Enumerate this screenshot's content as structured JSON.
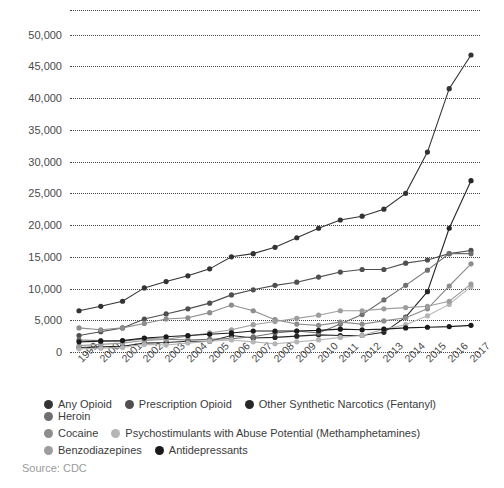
{
  "source_note": "Source: CDC",
  "chart_data": {
    "type": "line",
    "title": "",
    "xlabel": "",
    "ylabel": "",
    "ylim": [
      0,
      52000
    ],
    "yticks": [
      "0",
      "5,000",
      "10,000",
      "15,000",
      "20,000",
      "25,000",
      "30,000",
      "35,000",
      "40,000",
      "45,000",
      "50,000"
    ],
    "ytick_values": [
      0,
      5000,
      10000,
      15000,
      20000,
      25000,
      30000,
      35000,
      40000,
      45000,
      50000
    ],
    "grid": "horizontal-dotted",
    "legend_position": "bottom",
    "categories": [
      "1999",
      "2000",
      "2001",
      "2002",
      "2003",
      "2004",
      "2005",
      "2006",
      "2007",
      "2008",
      "2009",
      "2010",
      "2011",
      "2012",
      "2013",
      "2014",
      "2015",
      "2016",
      "2017"
    ],
    "series": [
      {
        "name": "Any Opioid",
        "color": "#333333",
        "values": [
          6500,
          7200,
          8000,
          10100,
          11100,
          12000,
          13100,
          15000,
          15500,
          16500,
          18000,
          19500,
          20800,
          21400,
          22500,
          25000,
          31500,
          41500,
          46800
        ]
      },
      {
        "name": "Prescription Opioid",
        "color": "#4f4f4f",
        "values": [
          2600,
          3200,
          3800,
          5200,
          6000,
          6800,
          7700,
          9000,
          9800,
          10500,
          11000,
          11800,
          12600,
          13000,
          13000,
          14000,
          14500,
          15500,
          16000
        ]
      },
      {
        "name": "Other Synthetic Narcotics (Fentanyl)",
        "color": "#262626",
        "values": [
          700,
          800,
          900,
          1400,
          1500,
          1700,
          1700,
          2600,
          2200,
          2300,
          2500,
          2700,
          2600,
          2600,
          3100,
          5500,
          9500,
          19500,
          27000
        ]
      },
      {
        "name": "Heroin",
        "color": "#6f6f6f",
        "values": [
          1900,
          1800,
          1700,
          2100,
          2000,
          1900,
          2000,
          2100,
          2400,
          3000,
          3300,
          3000,
          4400,
          5900,
          8200,
          10500,
          12900,
          15500,
          15500
        ]
      },
      {
        "name": "Cocaine",
        "color": "#8d8d8d",
        "values": [
          3800,
          3500,
          3800,
          4500,
          5200,
          5400,
          6200,
          7400,
          6500,
          5100,
          4400,
          4200,
          4700,
          4400,
          4900,
          5400,
          6800,
          10400,
          13900
        ]
      },
      {
        "name": "Psychostimulants with Abuse Potential (Methamphetamines)",
        "color": "#b5b5b5",
        "values": [
          500,
          600,
          700,
          1200,
          1100,
          1400,
          1700,
          1900,
          1600,
          1300,
          1600,
          1900,
          2300,
          2600,
          3600,
          4300,
          5700,
          7500,
          10300
        ]
      },
      {
        "name": "Benzodiazepines",
        "color": "#9d9d9d",
        "values": [
          1000,
          1200,
          1400,
          1800,
          2000,
          2500,
          3000,
          3500,
          4300,
          4800,
          5300,
          5800,
          6500,
          6500,
          6800,
          7000,
          7200,
          8000,
          10700
        ]
      },
      {
        "name": "Antidepressants",
        "color": "#1a1a1a",
        "values": [
          1600,
          1700,
          1800,
          2200,
          2400,
          2600,
          2800,
          3000,
          3300,
          3300,
          3300,
          3400,
          3600,
          3500,
          3600,
          3800,
          3900,
          4000,
          4200
        ]
      }
    ]
  }
}
